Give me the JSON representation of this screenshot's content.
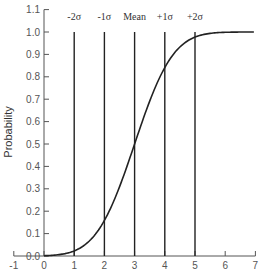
{
  "chart_data": {
    "type": "line",
    "title": "",
    "xlabel": "",
    "ylabel": "Probability",
    "xlim": [
      -1,
      7
    ],
    "ylim": [
      0.0,
      1.1
    ],
    "grid": false,
    "x_ticks": [
      "-1",
      "0",
      "1",
      "2",
      "3",
      "4",
      "5",
      "6",
      "7"
    ],
    "y_ticks": [
      "0.0",
      "0.1",
      "0.2",
      "0.3",
      "0.4",
      "0.5",
      "0.6",
      "0.7",
      "0.8",
      "0.9",
      "1.0",
      "1.1"
    ],
    "series": [
      {
        "name": "Cumulative normal distribution (mean 3, sd 1)",
        "x": [
          0,
          0.5,
          1,
          1.5,
          2,
          2.5,
          3,
          3.5,
          4,
          4.5,
          5,
          5.5,
          6,
          6.5
        ],
        "values": [
          0.001,
          0.006,
          0.023,
          0.067,
          0.159,
          0.309,
          0.5,
          0.691,
          0.841,
          0.933,
          0.977,
          0.994,
          0.999,
          1.0
        ]
      }
    ],
    "annotations": [
      {
        "label": "-2σ",
        "x": 1,
        "type": "vertical-line",
        "y_top": 1.0
      },
      {
        "label": "-1σ",
        "x": 2,
        "type": "vertical-line",
        "y_top": 1.0
      },
      {
        "label": "Mean",
        "x": 3,
        "type": "vertical-line",
        "y_top": 1.0
      },
      {
        "label": "+1σ",
        "x": 4,
        "type": "vertical-line",
        "y_top": 1.0
      },
      {
        "label": "+2σ",
        "x": 5,
        "type": "vertical-line",
        "y_top": 1.0
      }
    ],
    "mean": 3,
    "sigma": 1
  },
  "colors": {
    "axis": "#555555",
    "curve": "#222222",
    "marker_lines": "#222222",
    "text": "#555555"
  }
}
